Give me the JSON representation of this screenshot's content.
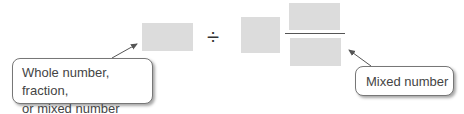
{
  "diagram": {
    "operator": "÷",
    "left_callout": {
      "line1": "Whole number, fraction,",
      "line2": "or mixed number"
    },
    "right_callout": {
      "label": "Mixed number"
    },
    "colors": {
      "placeholder": "#dcdcdc",
      "arrow": "#555555",
      "text": "#444444"
    }
  }
}
